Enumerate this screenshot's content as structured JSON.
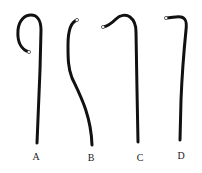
{
  "figure": {
    "background": "#ffffff",
    "stroke_color": "#111111",
    "items": [
      {
        "label": "A",
        "shape": "hook-loop",
        "label_pos": [
          36,
          151
        ]
      },
      {
        "label": "B",
        "shape": "s-curve",
        "label_pos": [
          91,
          152
        ]
      },
      {
        "label": "C",
        "shape": "crook",
        "label_pos": [
          140,
          152
        ]
      },
      {
        "label": "D",
        "shape": "bent-top",
        "label_pos": [
          181,
          150
        ]
      }
    ]
  }
}
